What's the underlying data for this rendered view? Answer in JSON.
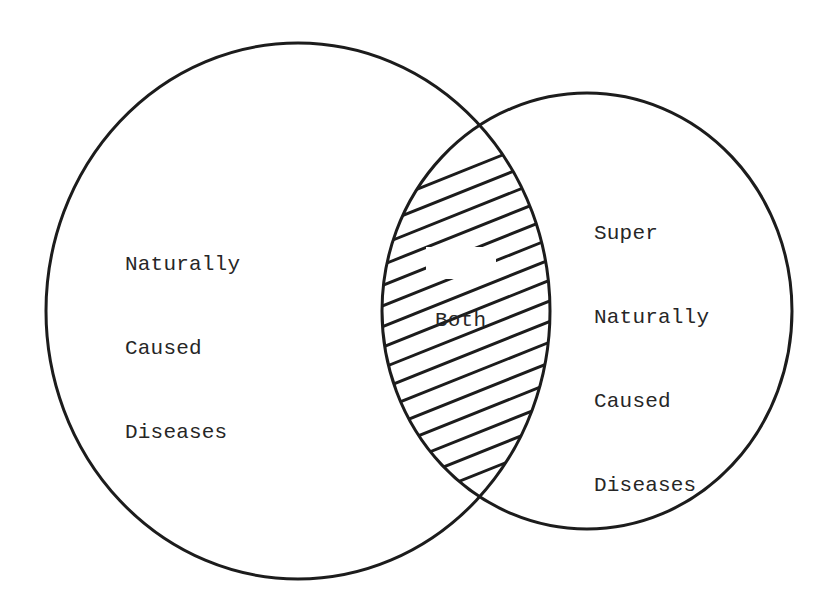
{
  "diagram": {
    "type": "venn",
    "sets": [
      {
        "id": "natural",
        "label_lines": [
          "Naturally",
          "Caused",
          "Diseases"
        ],
        "shape": {
          "cx": 298,
          "cy": 311,
          "rx": 252,
          "ry": 268
        }
      },
      {
        "id": "supernatural",
        "label_lines": [
          "Super",
          "Naturally",
          "Caused",
          "Diseases"
        ],
        "shape": {
          "cx": 587,
          "cy": 311,
          "rx": 205,
          "ry": 218
        }
      }
    ],
    "intersection": {
      "label": "Both",
      "fill": "hatched",
      "hatch": {
        "slope": -0.4,
        "first_intercept": 356,
        "spacing": 20.6,
        "count": 16,
        "label_gap": {
          "x": 426,
          "y": 247,
          "width": 70,
          "height": 32
        }
      }
    },
    "colors": {
      "stroke": "#1c1c1c",
      "text": "#262626",
      "background": "#ffffff"
    },
    "stroke_width": 3
  },
  "labels": {
    "left": {
      "line1": "Naturally",
      "line2": "Caused",
      "line3": "Diseases"
    },
    "right": {
      "line1": "Super",
      "line2": "Naturally",
      "line3": "Caused",
      "line4": "Diseases"
    },
    "both": "Both"
  }
}
